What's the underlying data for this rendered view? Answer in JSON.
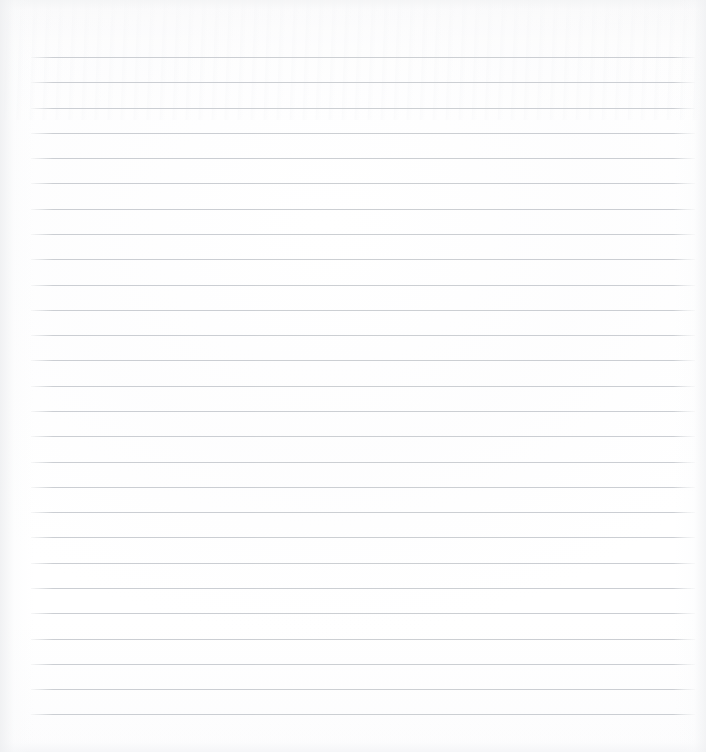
{
  "page": {
    "kind": "ruled-paper-sheet",
    "width": 706,
    "height": 752,
    "background_color": "#fdfdfd",
    "paper_color": "#fefefe",
    "rule_color": "#c9ccd1",
    "content_text": ""
  },
  "ruling": {
    "line_count": 27,
    "first_line_y": 57,
    "line_pitch": 25.3,
    "line_left_x": 31,
    "line_right_x": 695,
    "line_width": 664,
    "line_thickness": 1,
    "margin_line": false,
    "header_line": false
  },
  "lines": [
    {
      "index": 1,
      "y": 57,
      "text": ""
    },
    {
      "index": 2,
      "y": 82,
      "text": ""
    },
    {
      "index": 3,
      "y": 108,
      "text": ""
    },
    {
      "index": 4,
      "y": 133,
      "text": ""
    },
    {
      "index": 5,
      "y": 158,
      "text": ""
    },
    {
      "index": 6,
      "y": 183,
      "text": ""
    },
    {
      "index": 7,
      "y": 209,
      "text": ""
    },
    {
      "index": 8,
      "y": 234,
      "text": ""
    },
    {
      "index": 9,
      "y": 259,
      "text": ""
    },
    {
      "index": 10,
      "y": 285,
      "text": ""
    },
    {
      "index": 11,
      "y": 310,
      "text": ""
    },
    {
      "index": 12,
      "y": 335,
      "text": ""
    },
    {
      "index": 13,
      "y": 360,
      "text": ""
    },
    {
      "index": 14,
      "y": 386,
      "text": ""
    },
    {
      "index": 15,
      "y": 411,
      "text": ""
    },
    {
      "index": 16,
      "y": 436,
      "text": ""
    },
    {
      "index": 17,
      "y": 462,
      "text": ""
    },
    {
      "index": 18,
      "y": 487,
      "text": ""
    },
    {
      "index": 19,
      "y": 512,
      "text": ""
    },
    {
      "index": 20,
      "y": 537,
      "text": ""
    },
    {
      "index": 21,
      "y": 563,
      "text": ""
    },
    {
      "index": 22,
      "y": 588,
      "text": ""
    },
    {
      "index": 23,
      "y": 613,
      "text": ""
    },
    {
      "index": 24,
      "y": 639,
      "text": ""
    },
    {
      "index": 25,
      "y": 664,
      "text": ""
    },
    {
      "index": 26,
      "y": 689,
      "text": ""
    },
    {
      "index": 27,
      "y": 714,
      "text": ""
    }
  ]
}
